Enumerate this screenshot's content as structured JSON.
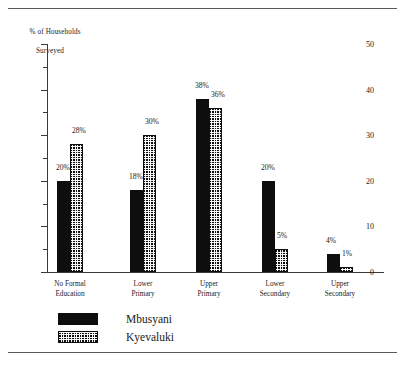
{
  "figure": {
    "y_axis_title_line1": "% of Households",
    "y_axis_title_line2": "Surveyed"
  },
  "chart_data": {
    "type": "bar",
    "title": "",
    "xlabel": "",
    "ylabel": "% of Households Surveyed",
    "ylim": [
      0,
      50
    ],
    "yticks": [
      0,
      10,
      20,
      30,
      40,
      50
    ],
    "ytick_labels": [
      "0",
      "10",
      "20",
      "30",
      "40",
      "50"
    ],
    "yminor_ticks": [
      5,
      15,
      25,
      35,
      45
    ],
    "grid": false,
    "legend_position": "bottom-left",
    "categories": [
      "No Formal\nEducation",
      "Lower\nPrimary",
      "Upper\nPrimary",
      "Lower\nSecondary",
      "Upper\nSecondary"
    ],
    "series": [
      {
        "name": "Mbusyani",
        "fill": "solid-black",
        "values": [
          20,
          18,
          38,
          20,
          4
        ],
        "labels": [
          "20%",
          "18%",
          "38%",
          "20%",
          "4%"
        ]
      },
      {
        "name": "Kyevaluki",
        "fill": "dotted-checker",
        "values": [
          28,
          30,
          36,
          5,
          1
        ],
        "labels": [
          "28%",
          "30%",
          "36%",
          "5%",
          "1%"
        ]
      }
    ]
  },
  "legend": {
    "items": [
      {
        "label": "Mbusyani",
        "swatch": "solid-black"
      },
      {
        "label": "Kyevaluki",
        "swatch": "dotted-checker"
      }
    ]
  }
}
